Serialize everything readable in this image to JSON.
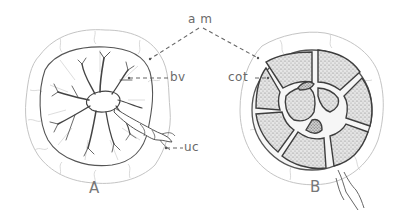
{
  "figure": {
    "labels": {
      "am": "a m",
      "bv": "bv",
      "uc": "uc",
      "cot": "cot",
      "A": "A",
      "B": "B"
    },
    "panels": [
      {
        "id": "A",
        "description": "placenta with branching blood vessels and umbilical cord"
      },
      {
        "id": "B",
        "description": "placenta showing cotyledons"
      }
    ],
    "colors": {
      "ink": "#555555",
      "light_ink": "#bbbbbb",
      "stipple": "#8a8a8a"
    }
  }
}
